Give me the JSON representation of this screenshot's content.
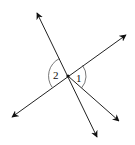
{
  "diagram": {
    "angles": [
      {
        "id": "angle-1",
        "label": "1"
      },
      {
        "id": "angle-2",
        "label": "2"
      }
    ],
    "colors": {
      "stroke": "#222222",
      "arc": "#555555",
      "background": "#ffffff"
    }
  }
}
